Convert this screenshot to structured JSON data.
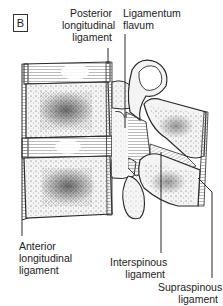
{
  "figure": {
    "panel_label": "B"
  },
  "labels": {
    "posterior_longitudinal": [
      "Posterior",
      "longitudinal",
      "ligament"
    ],
    "ligamentum_flavum": [
      "Ligamentum",
      "flavum"
    ],
    "anterior_longitudinal": [
      "Anterior",
      "longitudinal",
      "ligament"
    ],
    "interspinous": [
      "Interspinous",
      "ligament"
    ],
    "supraspinous": [
      "Supraspinous",
      "ligament"
    ]
  },
  "colors": {
    "line": "#2a2a2a",
    "ligament_shade": "#9a9a9a",
    "disc_shade": "#b5b5b5",
    "bone_fill": "#f2f2f2",
    "stipple": "#333333"
  }
}
